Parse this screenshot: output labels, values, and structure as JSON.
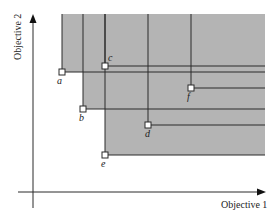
{
  "diagram": {
    "type": "pareto-dominance",
    "x_axis_label": "Objective 1",
    "y_axis_label": "Objective 2",
    "colors": {
      "region_fill": "#b4b4b4",
      "line": "#2a2a2a",
      "point_fill": "#ffffff",
      "background": "#ffffff"
    },
    "region_bounds": {
      "right": 265,
      "top": 14
    },
    "points": [
      {
        "id": "a",
        "label": "a",
        "x": 62,
        "y": 72,
        "label_dx": -5,
        "label_dy": 12
      },
      {
        "id": "b",
        "label": "b",
        "x": 83,
        "y": 109,
        "label_dx": -4,
        "label_dy": 12
      },
      {
        "id": "c",
        "label": "c",
        "x": 105,
        "y": 66,
        "label_dx": 3,
        "label_dy": -5
      },
      {
        "id": "d",
        "label": "d",
        "x": 148,
        "y": 125,
        "label_dx": -3,
        "label_dy": 12
      },
      {
        "id": "e",
        "label": "e",
        "x": 105,
        "y": 155,
        "label_dx": -4,
        "label_dy": 12
      },
      {
        "id": "f",
        "label": "f",
        "x": 191,
        "y": 88,
        "label_dx": -4,
        "label_dy": 12
      }
    ]
  }
}
